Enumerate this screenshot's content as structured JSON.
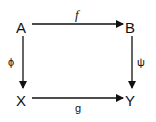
{
  "diagram": {
    "type": "commutative-square",
    "nodes": {
      "top_left": "A",
      "top_right": "B",
      "bottom_left": "X",
      "bottom_right": "Y"
    },
    "arrows": {
      "top": {
        "from": "A",
        "to": "B",
        "label": "f"
      },
      "left": {
        "from": "A",
        "to": "X",
        "label": "ϕ"
      },
      "right": {
        "from": "B",
        "to": "Y",
        "label": "ψ"
      },
      "bottom": {
        "from": "X",
        "to": "Y",
        "label": "g"
      }
    }
  }
}
